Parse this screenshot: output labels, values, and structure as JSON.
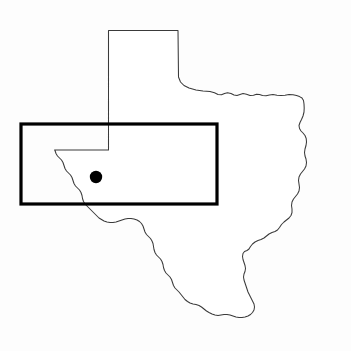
{
  "figure": {
    "name": "texas-state-outline-map",
    "title": "Outline map of Texas with highlighted rectangular study area and single point location",
    "width": 351,
    "height": 351,
    "background_color": "#fdfdfd"
  },
  "layers": {
    "state_outline": {
      "label": "Texas state boundary",
      "stroke_color": "#3a3a3a",
      "fill_color": "#ffffff",
      "stroke_width": 1.05
    },
    "region_rectangle": {
      "label": "Study area rectangle",
      "stroke_color": "#000000",
      "stroke_width": 3.2,
      "x": 21,
      "y": 124,
      "width": 196,
      "height": 80
    },
    "site_marker": {
      "label": "Site location marker",
      "fill_color": "#000000",
      "cx": 96,
      "cy": 177,
      "r": 6.2
    }
  },
  "geometry": {
    "texas_path": "M 108.5 30.5 L 178.0 30.5 L 178.5 77.0 L 180.5 82.0 L 184.0 85.5 L 189.0 88.0 L 196.0 90.0 L 203.0 91.0 L 210.0 91.5 L 214.5 92.8 L 218.0 94.5 L 221.5 94.8 L 224.5 93.5 L 227.5 92.8 L 231.0 93.5 L 234.0 95.0 L 237.0 95.4 L 240.0 94.4 L 243.0 93.6 L 246.5 94.2 L 250.0 95.4 L 253.5 95.2 L 256.5 94.2 L 259.5 94.6 L 262.5 95.6 L 266.0 95.8 L 269.5 95.0 L 273.0 94.6 L 277.0 95.2 L 281.0 95.6 L 285.0 95.2 L 289.0 94.6 L 293.0 94.8 L 296.5 95.6 L 299.5 96.6 L 302.0 98.0 L 303.5 100.5 L 304.0 104.0 L 304.2 108.0 L 304.0 112.0 L 303.0 116.0 L 301.5 119.5 L 300.0 122.5 L 299.0 125.5 L 299.5 128.5 L 301.0 131.0 L 303.0 133.0 L 305.0 135.5 L 306.2 138.5 L 306.5 142.0 L 306.0 145.5 L 305.0 149.0 L 304.5 152.5 L 305.0 156.0 L 306.0 159.0 L 306.5 162.5 L 306.0 166.0 L 304.5 169.0 L 302.5 171.5 L 300.5 174.0 L 299.0 177.0 L 298.5 180.5 L 299.0 184.0 L 299.5 187.5 L 299.0 191.0 L 297.5 194.0 L 295.5 196.5 L 293.5 199.0 L 292.0 202.0 L 291.5 205.5 L 292.0 209.0 L 292.0 212.5 L 291.0 215.5 L 289.0 218.0 L 286.5 220.0 L 284.0 222.0 L 281.5 224.5 L 279.5 227.5 L 277.5 230.0 L 275.0 231.5 L 272.0 232.5 L 269.0 234.0 L 266.5 236.0 L 264.0 238.0 L 261.0 239.5 L 258.0 240.5 L 255.0 242.0 L 252.5 244.0 L 250.5 246.5 L 249.0 249.0 L 247.0 250.5 L 244.5 251.5 L 243.0 253.5 L 242.5 256.5 L 243.0 259.5 L 244.0 262.5 L 245.0 265.5 L 245.5 268.5 L 245.0 271.5 L 244.0 274.0 L 243.5 277.0 L 244.0 280.0 L 245.0 283.0 L 246.0 286.0 L 247.0 289.0 L 248.0 292.0 L 249.5 295.0 L 251.0 298.0 L 252.5 301.0 L 254.0 304.0 L 254.5 307.0 L 254.0 310.0 L 252.5 312.5 L 250.5 314.5 L 248.0 316.0 L 245.0 317.0 L 242.0 317.5 L 239.0 317.5 L 236.0 317.0 L 233.0 316.0 L 230.0 315.0 L 227.0 314.5 L 224.0 314.5 L 221.0 315.0 L 218.0 315.5 L 215.0 315.0 L 212.0 314.0 L 209.0 312.5 L 206.5 311.0 L 204.0 309.0 L 201.5 307.0 L 199.0 305.5 L 196.0 304.5 L 193.0 304.0 L 190.0 303.0 L 187.5 301.5 L 185.0 299.5 L 183.0 297.0 L 181.0 294.5 L 179.0 292.0 L 177.0 290.0 L 175.0 288.0 L 173.5 285.5 L 172.5 282.5 L 171.5 279.5 L 170.0 277.0 L 168.0 275.0 L 166.0 273.0 L 164.5 270.5 L 163.5 267.5 L 163.0 264.5 L 162.0 261.5 L 160.5 259.0 L 158.5 257.0 L 156.5 255.0 L 155.0 252.5 L 154.0 249.5 L 153.5 246.5 L 153.0 243.5 L 152.0 241.0 L 150.5 238.5 L 148.5 236.5 L 146.5 234.5 L 145.0 232.0 L 144.0 229.0 L 143.0 226.0 L 141.5 223.5 L 139.5 221.5 L 137.0 220.0 L 134.0 219.0 L 131.0 218.5 L 128.0 218.5 L 125.0 219.0 L 122.0 220.0 L 119.0 221.0 L 116.0 222.0 L 113.0 222.5 L 110.0 222.5 L 107.0 222.0 L 104.0 221.0 L 101.5 219.5 L 99.0 218.0 L 97.0 216.0 L 95.0 214.0 L 93.0 212.0 L 91.0 210.0 L 89.0 208.0 L 87.0 206.0 L 85.0 204.0 L 83.5 201.5 L 82.5 198.5 L 82.0 195.5 L 81.0 192.5 L 79.5 190.0 L 77.5 188.0 L 75.5 186.0 L 74.0 183.5 L 73.0 180.5 L 72.0 177.5 L 70.5 175.0 L 68.5 173.0 L 66.5 171.0 L 65.0 168.5 L 64.0 165.5 L 63.0 162.5 L 61.5 160.0 L 59.5 158.0 L 57.5 156.0 L 56.0 153.5 L 55.0 150.5 L 54.5 150.0 L 108.5 150.0 Z",
    "rio_grande_note": "western and southwestern boundary follows the Rio Grande"
  },
  "labels": {
    "state_name": "Texas",
    "marker_label": "",
    "region_label": ""
  }
}
